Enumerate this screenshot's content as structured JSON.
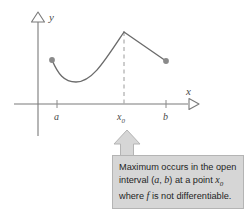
{
  "figure": {
    "axes": {
      "y_label": "y",
      "x_label": "x",
      "y_arrow_icon": "triangle-up-outline-icon",
      "x_arrow_icon": "triangle-right-outline-icon"
    },
    "ticks": [
      {
        "id": "a",
        "label": "a",
        "x": 57
      },
      {
        "id": "x0",
        "label": "x",
        "sub": "0",
        "x": 124
      },
      {
        "id": "b",
        "label": "b",
        "x": 166
      }
    ],
    "endpoints": [
      {
        "id": "left-endpoint",
        "cx": 52,
        "cy": 60
      },
      {
        "id": "right-endpoint",
        "cx": 166,
        "cy": 61
      }
    ],
    "dashed_guide": {
      "x": 124,
      "y_top": 32,
      "y_bottom": 104
    },
    "colors": {
      "curve": "#6b6b6b",
      "axis": "#7a7a7a",
      "dot": "#8a8a8a",
      "dashed": "#9a9a9a",
      "callout_fill": "#d6d6d6",
      "callout_border": "#b4b4b4",
      "text": "#1f1f1f"
    }
  },
  "callout": {
    "arrow_icon": "arrow-up-callout-icon",
    "lines": [
      "Maximum occurs in the open",
      "interval (a, b) at a point x0",
      "where f is not differentiable."
    ],
    "line1": "Maximum occurs in the open",
    "line2_pre": "interval (",
    "line2_a": "a",
    "line2_mid": ", ",
    "line2_b": "b",
    "line2_post": ") at a point ",
    "line2_x": "x",
    "line2_sub": "0",
    "line3_pre": "where ",
    "line3_f": "f",
    "line3_post": " is not differentiable."
  }
}
